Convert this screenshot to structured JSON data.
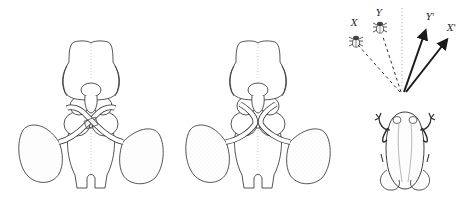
{
  "figure": {
    "panels": [
      {
        "id": "brain-crossed",
        "description": "Frog brain dorsal view with crossed optic nerves (normal chiasm)"
      },
      {
        "id": "brain-rerouted",
        "description": "Frog brain dorsal view with optic nerves rerouted (uncrossed / rotated)"
      },
      {
        "id": "targeting",
        "description": "Prey targets X and Y with frog's mis-directed strikes X' and Y'"
      }
    ],
    "labels": {
      "x": "X",
      "y": "Y",
      "y_prime": "Y'",
      "x_prime": "X'"
    },
    "colors": {
      "background": "#ffffff",
      "ink": "#2a2a2a",
      "stipple": "#9a9a9a"
    }
  }
}
